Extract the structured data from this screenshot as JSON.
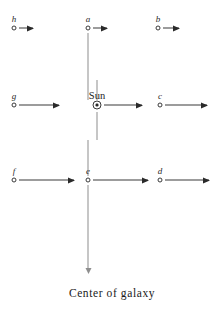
{
  "figure": {
    "caption": "Center of galaxy",
    "sun_label": "Sun",
    "sun_symbol_name": "sun-symbol-icon",
    "background_color": "#ffffff",
    "stroke_color": "#3a3a3a",
    "axis_color": "#8e8e8e",
    "nodes": [
      {
        "id": "h",
        "label": "h",
        "x": 14,
        "y": 28,
        "arrow_length": 20
      },
      {
        "id": "a",
        "label": "a",
        "x": 88,
        "y": 28,
        "arrow_length": 20
      },
      {
        "id": "b",
        "label": "b",
        "x": 158,
        "y": 28,
        "arrow_length": 20
      },
      {
        "id": "g",
        "label": "g",
        "x": 14,
        "y": 105,
        "arrow_length": 48
      },
      {
        "id": "c",
        "label": "c",
        "x": 160,
        "y": 105,
        "arrow_length": 48
      },
      {
        "id": "f",
        "label": "f",
        "x": 14,
        "y": 180,
        "arrow_length": 66
      },
      {
        "id": "e",
        "label": "e",
        "x": 88,
        "y": 180,
        "arrow_length": 66
      },
      {
        "id": "d",
        "label": "d",
        "x": 160,
        "y": 180,
        "arrow_length": 55
      }
    ],
    "sun": {
      "x": 97,
      "y": 105,
      "arrow_length": 48
    },
    "vertical_axis": {
      "x": 97,
      "top": 33,
      "bottom": 275
    },
    "caption_position": {
      "x": 112,
      "y": 287
    }
  }
}
